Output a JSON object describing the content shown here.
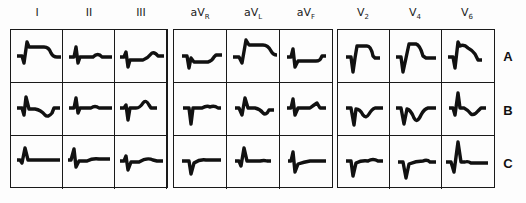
{
  "figure": {
    "leads": [
      "I",
      "II",
      "III",
      "aVR",
      "aVL",
      "aVF",
      "V2",
      "V4",
      "V6"
    ],
    "lead_labels": [
      {
        "base": "I",
        "sub": ""
      },
      {
        "base": "II",
        "sub": ""
      },
      {
        "base": "III",
        "sub": ""
      },
      {
        "base": "aV",
        "sub": "R"
      },
      {
        "base": "aV",
        "sub": "L"
      },
      {
        "base": "aV",
        "sub": "F"
      },
      {
        "base": "V",
        "sub": "2"
      },
      {
        "base": "V",
        "sub": "4"
      },
      {
        "base": "V",
        "sub": "6"
      }
    ],
    "rows": [
      "A",
      "B",
      "C"
    ],
    "groups": [
      {
        "name": "limb-leads",
        "leads": [
          "I",
          "II",
          "III"
        ]
      },
      {
        "name": "augmented-leads",
        "leads": [
          "aVR",
          "aVL",
          "aVF"
        ]
      },
      {
        "name": "precordial-leads",
        "leads": [
          "V2",
          "V4",
          "V6"
        ]
      }
    ],
    "trace_color": "#111111",
    "border_color": "#1a1a1a"
  }
}
